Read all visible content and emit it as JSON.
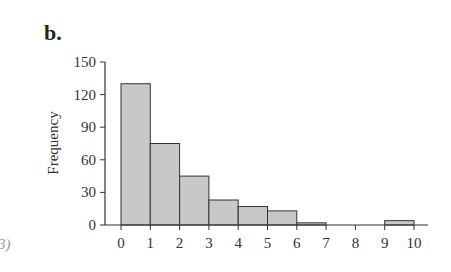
{
  "panel_label": "b.",
  "cut_text": "3)",
  "chart_data": {
    "type": "bar",
    "title": "",
    "xlabel": "",
    "ylabel": "Frequency",
    "bins": [
      [
        0,
        1
      ],
      [
        1,
        2
      ],
      [
        2,
        3
      ],
      [
        3,
        4
      ],
      [
        4,
        5
      ],
      [
        5,
        6
      ],
      [
        6,
        7
      ],
      [
        7,
        8
      ],
      [
        8,
        9
      ],
      [
        9,
        10
      ]
    ],
    "categories": [
      "0-1",
      "1-2",
      "2-3",
      "3-4",
      "4-5",
      "5-6",
      "6-7",
      "7-8",
      "8-9",
      "9-10"
    ],
    "values": [
      130,
      75,
      45,
      23,
      17,
      13,
      2,
      0,
      0,
      4
    ],
    "xticks": [
      "0",
      "1",
      "2",
      "3",
      "4",
      "5",
      "6",
      "7",
      "8",
      "9",
      "10"
    ],
    "yticks": [
      "0",
      "30",
      "60",
      "90",
      "120",
      "150"
    ],
    "ylim": [
      0,
      150
    ],
    "xlim": [
      0,
      10
    ],
    "grid": false,
    "legend": null,
    "bar_color": "#c8c8c8",
    "edge_color": "#333333"
  }
}
